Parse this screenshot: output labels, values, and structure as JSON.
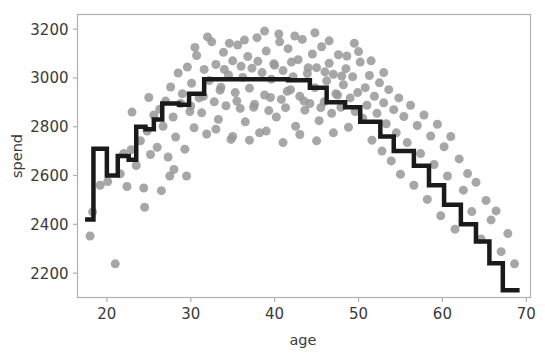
{
  "chart_data": {
    "type": "scatter",
    "title": "",
    "xlabel": "age",
    "ylabel": "spend",
    "xlim": [
      16.5,
      70.5
    ],
    "ylim": [
      2100,
      3260
    ],
    "grid": false,
    "legend": null,
    "xticks": [
      20,
      30,
      40,
      50,
      60,
      70
    ],
    "yticks": [
      2200,
      2400,
      2600,
      2800,
      3000,
      3200
    ],
    "series": [
      {
        "name": "observations",
        "type": "scatter",
        "color": "#989898",
        "marker": "o",
        "size": 9,
        "alpha": 0.85,
        "points": [
          [
            18.0,
            2352
          ],
          [
            18.3,
            2451
          ],
          [
            19.2,
            2560
          ],
          [
            20.1,
            2575
          ],
          [
            21.0,
            2238
          ],
          [
            21.6,
            2607
          ],
          [
            22.4,
            2555
          ],
          [
            22.9,
            2706
          ],
          [
            23.5,
            2641
          ],
          [
            24.0,
            2742
          ],
          [
            24.4,
            2549
          ],
          [
            24.8,
            2782
          ],
          [
            25.2,
            2686
          ],
          [
            25.6,
            2848
          ],
          [
            26.0,
            2716
          ],
          [
            26.3,
            2872
          ],
          [
            26.7,
            2802
          ],
          [
            27.0,
            2905
          ],
          [
            27.3,
            2676
          ],
          [
            27.6,
            2963
          ],
          [
            27.9,
            2840
          ],
          [
            28.2,
            2758
          ],
          [
            28.5,
            3020
          ],
          [
            28.8,
            2895
          ],
          [
            29.0,
            2935
          ],
          [
            29.3,
            2708
          ],
          [
            29.6,
            3045
          ],
          [
            29.9,
            2862
          ],
          [
            30.1,
            2978
          ],
          [
            30.4,
            2796
          ],
          [
            30.7,
            3092
          ],
          [
            31.0,
            2918
          ],
          [
            31.3,
            2857
          ],
          [
            31.6,
            3035
          ],
          [
            31.9,
            2770
          ],
          [
            32.2,
            2989
          ],
          [
            32.5,
            3148
          ],
          [
            32.8,
            2902
          ],
          [
            33.0,
            3055
          ],
          [
            33.3,
            2830
          ],
          [
            33.6,
            2962
          ],
          [
            33.9,
            3105
          ],
          [
            34.2,
            2886
          ],
          [
            34.5,
            3012
          ],
          [
            34.8,
            2748
          ],
          [
            35.0,
            3070
          ],
          [
            35.3,
            2940
          ],
          [
            35.6,
            3135
          ],
          [
            35.9,
            2875
          ],
          [
            36.2,
            3002
          ],
          [
            36.5,
            2820
          ],
          [
            36.8,
            3088
          ],
          [
            37.0,
            2958
          ],
          [
            37.3,
            3040
          ],
          [
            37.6,
            2892
          ],
          [
            37.9,
            3165
          ],
          [
            38.2,
            2775
          ],
          [
            38.5,
            3022
          ],
          [
            38.8,
            2930
          ],
          [
            39.0,
            3110
          ],
          [
            39.3,
            2866
          ],
          [
            39.6,
            2995
          ],
          [
            39.9,
            3058
          ],
          [
            40.2,
            2840
          ],
          [
            40.5,
            3180
          ],
          [
            40.8,
            2912
          ],
          [
            41.0,
            3030
          ],
          [
            41.3,
            2878
          ],
          [
            41.6,
            3120
          ],
          [
            41.9,
            2952
          ],
          [
            42.2,
            3005
          ],
          [
            42.5,
            2802
          ],
          [
            42.8,
            3075
          ],
          [
            43.0,
            2925
          ],
          [
            43.3,
            3158
          ],
          [
            43.6,
            2868
          ],
          [
            43.9,
            3018
          ],
          [
            44.2,
            2895
          ],
          [
            44.5,
            3098
          ],
          [
            44.8,
            2960
          ],
          [
            45.0,
            3042
          ],
          [
            45.3,
            2825
          ],
          [
            45.6,
            3128
          ],
          [
            45.9,
            2902
          ],
          [
            46.2,
            2988
          ],
          [
            46.5,
            3060
          ],
          [
            46.8,
            2855
          ],
          [
            47.0,
            3015
          ],
          [
            47.3,
            2935
          ],
          [
            47.6,
            3095
          ],
          [
            47.9,
            2880
          ],
          [
            48.2,
            2972
          ],
          [
            48.5,
            3038
          ],
          [
            48.8,
            2798
          ],
          [
            49.0,
            2918
          ],
          [
            49.3,
            3005
          ],
          [
            49.6,
            2862
          ],
          [
            49.9,
            2940
          ],
          [
            50.2,
            3065
          ],
          [
            50.5,
            2835
          ],
          [
            50.8,
            2960
          ],
          [
            51.0,
            2888
          ],
          [
            51.3,
            3010
          ],
          [
            51.6,
            2745
          ],
          [
            51.9,
            2925
          ],
          [
            52.2,
            2855
          ],
          [
            52.5,
            2980
          ],
          [
            52.8,
            2700
          ],
          [
            53.0,
            2898
          ],
          [
            53.3,
            2812
          ],
          [
            53.6,
            2952
          ],
          [
            53.9,
            2660
          ],
          [
            54.2,
            2870
          ],
          [
            54.5,
            2775
          ],
          [
            54.8,
            2918
          ],
          [
            55.0,
            2605
          ],
          [
            55.4,
            2842
          ],
          [
            55.8,
            2735
          ],
          [
            56.2,
            2888
          ],
          [
            56.6,
            2560
          ],
          [
            57.0,
            2805
          ],
          [
            57.4,
            2690
          ],
          [
            57.8,
            2848
          ],
          [
            58.2,
            2502
          ],
          [
            58.6,
            2762
          ],
          [
            59.0,
            2645
          ],
          [
            59.4,
            2810
          ],
          [
            59.8,
            2435
          ],
          [
            60.2,
            2718
          ],
          [
            60.6,
            2598
          ],
          [
            61.0,
            2760
          ],
          [
            61.5,
            2380
          ],
          [
            62.0,
            2668
          ],
          [
            62.5,
            2540
          ],
          [
            63.0,
            2608
          ],
          [
            63.5,
            2452
          ],
          [
            64.0,
            2572
          ],
          [
            64.6,
            2340
          ],
          [
            65.2,
            2498
          ],
          [
            65.8,
            2418
          ],
          [
            66.4,
            2455
          ],
          [
            67.0,
            2288
          ],
          [
            67.8,
            2362
          ],
          [
            68.6,
            2238
          ],
          [
            30.0,
            2885
          ],
          [
            31.5,
            2925
          ],
          [
            33.5,
            2950
          ],
          [
            35.5,
            2905
          ],
          [
            37.5,
            2880
          ],
          [
            39.5,
            2920
          ],
          [
            41.5,
            2945
          ],
          [
            43.5,
            2905
          ],
          [
            45.5,
            2878
          ],
          [
            47.5,
            2930
          ],
          [
            34.0,
            3035
          ],
          [
            36.0,
            3048
          ],
          [
            38.0,
            3068
          ],
          [
            40.0,
            3052
          ],
          [
            42.0,
            3065
          ],
          [
            44.0,
            3042
          ],
          [
            46.0,
            3025
          ],
          [
            48.0,
            3008
          ],
          [
            33.0,
            2790
          ],
          [
            35.0,
            2760
          ],
          [
            37.0,
            2745
          ],
          [
            39.0,
            2782
          ],
          [
            41.0,
            2735
          ],
          [
            43.0,
            2768
          ],
          [
            45.0,
            2742
          ],
          [
            47.0,
            2775
          ],
          [
            28.0,
            2625
          ],
          [
            29.5,
            2598
          ],
          [
            24.5,
            2470
          ],
          [
            26.5,
            2538
          ],
          [
            50.0,
            3108
          ],
          [
            51.5,
            3070
          ],
          [
            49.5,
            3142
          ],
          [
            53.0,
            3022
          ],
          [
            30.5,
            3125
          ],
          [
            32.0,
            3168
          ],
          [
            44.8,
            3185
          ],
          [
            46.5,
            3152
          ],
          [
            38.8,
            3192
          ],
          [
            40.6,
            3148
          ],
          [
            42.4,
            3172
          ],
          [
            36.4,
            3155
          ],
          [
            34.6,
            3142
          ],
          [
            48.6,
            3090
          ],
          [
            25.0,
            2920
          ],
          [
            27.5,
            2598
          ],
          [
            23.0,
            2860
          ],
          [
            22.0,
            2690
          ]
        ]
      },
      {
        "name": "fitted-step",
        "type": "step",
        "color": "#1a1a1a",
        "linewidth": 4.5,
        "steps": [
          [
            17.4,
            2420
          ],
          [
            18.4,
            2420
          ],
          [
            18.4,
            2710
          ],
          [
            20.0,
            2710
          ],
          [
            20.0,
            2600
          ],
          [
            21.3,
            2600
          ],
          [
            21.3,
            2680
          ],
          [
            22.6,
            2680
          ],
          [
            22.6,
            2665
          ],
          [
            23.5,
            2665
          ],
          [
            23.5,
            2800
          ],
          [
            24.6,
            2800
          ],
          [
            24.6,
            2790
          ],
          [
            25.6,
            2790
          ],
          [
            25.6,
            2830
          ],
          [
            26.6,
            2830
          ],
          [
            26.6,
            2895
          ],
          [
            28.6,
            2895
          ],
          [
            28.6,
            2890
          ],
          [
            29.8,
            2890
          ],
          [
            29.8,
            2935
          ],
          [
            31.6,
            2935
          ],
          [
            31.6,
            2995
          ],
          [
            41.6,
            2995
          ],
          [
            41.6,
            2990
          ],
          [
            44.2,
            2990
          ],
          [
            44.2,
            2960
          ],
          [
            46.2,
            2960
          ],
          [
            46.2,
            2900
          ],
          [
            48.4,
            2900
          ],
          [
            48.4,
            2880
          ],
          [
            50.2,
            2880
          ],
          [
            50.2,
            2820
          ],
          [
            52.6,
            2820
          ],
          [
            52.6,
            2760
          ],
          [
            54.2,
            2760
          ],
          [
            54.2,
            2700
          ],
          [
            56.6,
            2700
          ],
          [
            56.6,
            2640
          ],
          [
            58.4,
            2640
          ],
          [
            58.4,
            2560
          ],
          [
            60.2,
            2560
          ],
          [
            60.2,
            2480
          ],
          [
            62.2,
            2480
          ],
          [
            62.2,
            2400
          ],
          [
            64.0,
            2400
          ],
          [
            64.0,
            2330
          ],
          [
            65.6,
            2330
          ],
          [
            65.6,
            2240
          ],
          [
            67.2,
            2240
          ],
          [
            67.2,
            2130
          ],
          [
            69.2,
            2130
          ]
        ]
      }
    ],
    "colors": {
      "scatter": "#989898",
      "line": "#1a1a1a",
      "frame": "#b0b0b0",
      "text": "#3a3a3a",
      "background": "#ffffff"
    }
  },
  "axes": {
    "x_label": "age",
    "y_label": "spend",
    "x_tick_labels": [
      "20",
      "30",
      "40",
      "50",
      "60",
      "70"
    ],
    "y_tick_labels": [
      "2200",
      "2400",
      "2600",
      "2800",
      "3000",
      "3200"
    ]
  }
}
